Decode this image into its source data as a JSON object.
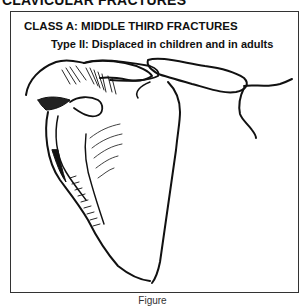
{
  "page": {
    "section_heading": "CLAVICULAR FRACTURES"
  },
  "figure": {
    "class_title": "CLASS A: MIDDLE THIRD FRACTURES",
    "type_subtitle": "Type II: Displaced in children and in adults",
    "illustration": "shoulder-scapula-clavicle-line-drawing",
    "caption": "Figure"
  },
  "colors": {
    "ink": "#111111",
    "frame": "#333333",
    "background": "#ffffff"
  }
}
